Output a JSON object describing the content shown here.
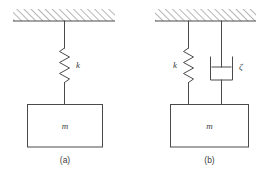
{
  "figure": {
    "background_color": "#ffffff",
    "line_color": "#4a4a4a",
    "panels": [
      {
        "id": "panel-a",
        "caption": "(a)",
        "description": "Undamped single-degree-of-freedom spring-mass system",
        "ceiling": {
          "hatched": true
        },
        "elements": [
          {
            "type": "spring",
            "label": "k",
            "label_side": "right"
          },
          {
            "type": "mass",
            "label": "m"
          }
        ]
      },
      {
        "id": "panel-b",
        "caption": "(b)",
        "description": "Damped single-degree-of-freedom spring-mass-damper system",
        "ceiling": {
          "hatched": true
        },
        "elements": [
          {
            "type": "spring",
            "label": "k",
            "label_side": "left"
          },
          {
            "type": "damper",
            "label": "ζ",
            "label_side": "right"
          },
          {
            "type": "mass",
            "label": "m"
          }
        ]
      }
    ],
    "labels": {
      "spring_a": "k",
      "mass_a": "m",
      "caption_a": "(a)",
      "spring_b": "k",
      "damper_b": "ζ",
      "mass_b": "m",
      "caption_b": "(b)"
    }
  }
}
